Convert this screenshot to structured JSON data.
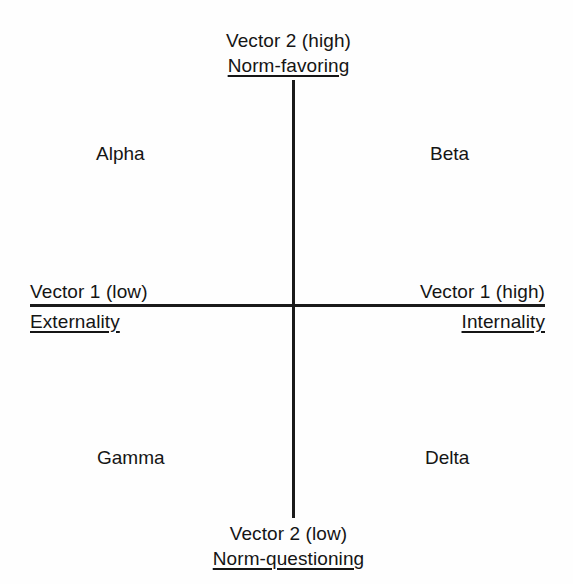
{
  "diagram": {
    "type": "two-by-two-quadrant-map",
    "background_color": "#fefefe",
    "line_color": "#1a1a1a",
    "text_color": "#151515",
    "axes": {
      "vertical": {
        "name": "Vector 2",
        "top": {
          "line1": "Vector 2 (high)",
          "line2": "Norm-favoring",
          "line1_underlined": false,
          "line2_underlined": true
        },
        "bottom": {
          "line1": "Vector 2 (low)",
          "line2": "Norm-questioning",
          "line1_underlined": false,
          "line2_underlined": true
        }
      },
      "horizontal": {
        "name": "Vector 1",
        "left": {
          "line1": "Vector 1 (low)",
          "line2": "Externality",
          "line1_underlined": false,
          "line2_underlined": true
        },
        "right": {
          "line1": "Vector 1 (high)",
          "line2": "Internality",
          "line1_underlined": false,
          "line2_underlined": true
        }
      }
    },
    "quadrants": [
      {
        "id": "upper-left",
        "label": "Alpha"
      },
      {
        "id": "upper-right",
        "label": "Beta"
      },
      {
        "id": "lower-left",
        "label": "Gamma"
      },
      {
        "id": "lower-right",
        "label": "Delta"
      }
    ]
  }
}
